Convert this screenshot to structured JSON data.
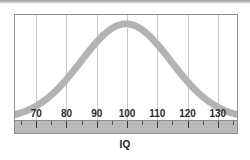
{
  "figure": {
    "background_color": "#ffffff",
    "panel_border_color": "#8e8e8e",
    "gridline_color": "#c8c8c8",
    "curve_color": "#b3b3b3",
    "axis_band_color": "#b9b9b9",
    "tick_color": "#3a3a3a",
    "label_color": "#2b2b2b"
  },
  "chart_data": {
    "type": "line",
    "title": "",
    "subtitle": "",
    "xlabel": "IQ",
    "ylabel": "",
    "legend": [],
    "legend_position": "none",
    "grid": true,
    "grid_axis": "x",
    "xlim": [
      63,
      137
    ],
    "ylim": [
      0,
      1
    ],
    "xticks": [
      70,
      80,
      90,
      100,
      110,
      120,
      130
    ],
    "xtick_labels": [
      "70",
      "80",
      "90",
      "100",
      "110",
      "120",
      "130"
    ],
    "minor_xticks": [
      65,
      75,
      85,
      95,
      105,
      115,
      125,
      135
    ],
    "yticks": [],
    "ytick_labels": [],
    "distribution": {
      "name": "normal",
      "mean": 100,
      "std_dev": 15,
      "peak_x": 100,
      "peak_y": 1.0
    },
    "x": [
      63,
      65,
      70,
      75,
      80,
      85,
      90,
      95,
      100,
      105,
      110,
      115,
      120,
      125,
      130,
      135,
      137
    ],
    "series": [
      {
        "name": "IQ distribution",
        "color": "#b3b3b3",
        "line_width": 7,
        "values": [
          0.02,
          0.03,
          0.07,
          0.14,
          0.26,
          0.41,
          0.61,
          0.8,
          1.0,
          0.8,
          0.61,
          0.41,
          0.26,
          0.14,
          0.07,
          0.03,
          0.02
        ]
      }
    ],
    "annotations": []
  },
  "axis": {
    "title": "IQ",
    "ticks": [
      {
        "value": 70,
        "label": "70"
      },
      {
        "value": 80,
        "label": "80"
      },
      {
        "value": 90,
        "label": "90"
      },
      {
        "value": 100,
        "label": "100"
      },
      {
        "value": 110,
        "label": "110"
      },
      {
        "value": 120,
        "label": "120"
      },
      {
        "value": 130,
        "label": "130"
      }
    ]
  }
}
